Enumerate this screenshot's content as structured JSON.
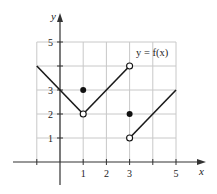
{
  "chart_data": {
    "type": "line",
    "title": "",
    "annotation": "y = f(x)",
    "xlabel": "x",
    "ylabel": "y",
    "xlim": [
      -1,
      5
    ],
    "ylim": [
      0,
      5
    ],
    "x_tick_labels": [
      "1",
      "2",
      "3",
      "5"
    ],
    "x_ticks": [
      -1,
      1,
      2,
      3,
      4,
      5
    ],
    "y_tick_labels": [
      "1",
      "2",
      "3",
      "5"
    ],
    "y_ticks": [
      1,
      2,
      3,
      4,
      5
    ],
    "grid": true,
    "segments": [
      {
        "from": [
          -1,
          4
        ],
        "to": [
          1,
          2
        ],
        "start_closed": null,
        "end_closed": false
      },
      {
        "from": [
          1,
          2
        ],
        "to": [
          3,
          4
        ],
        "start_closed": false,
        "end_closed": false
      },
      {
        "from": [
          3,
          1
        ],
        "to": [
          5,
          3
        ],
        "start_closed": false,
        "end_closed": null
      }
    ],
    "filled_points": [
      [
        1,
        3
      ],
      [
        3,
        2
      ]
    ],
    "open_points": [
      [
        1,
        2
      ],
      [
        3,
        4
      ],
      [
        3,
        1
      ]
    ]
  },
  "labels": {
    "annotation": "y = f(x)",
    "x_axis": "x",
    "y_axis": "y"
  }
}
